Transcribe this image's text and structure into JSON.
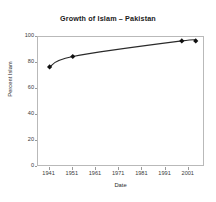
{
  "chart_data": {
    "type": "line",
    "title": "Growth of Islam – Pakistan",
    "xlabel": "Date",
    "ylabel": "Percent Islam",
    "xlim": [
      1936,
      2008
    ],
    "ylim": [
      0,
      100
    ],
    "xticks": [
      1941,
      1951,
      1961,
      1971,
      1981,
      1991,
      2001
    ],
    "xtick_labels": [
      "1941",
      "1951",
      "1961",
      "1971",
      "1981",
      "1991",
      "2001"
    ],
    "yticks": [
      0,
      20,
      40,
      60,
      80,
      100
    ],
    "ytick_labels": [
      "0",
      "20",
      "40",
      "60",
      "80",
      "100"
    ],
    "grid": false,
    "legend": "none",
    "series": [
      {
        "name": "Percent Islam",
        "marker": "diamond",
        "marker_color": "#111111",
        "line_color": "#2a2a2a",
        "x": [
          1941,
          1951,
          1998,
          2004
        ],
        "values": [
          77,
          85,
          97,
          97
        ],
        "points": [
          {
            "x": 1941,
            "y": 77
          },
          {
            "x": 1951,
            "y": 85
          },
          {
            "x": 1998,
            "y": 97
          },
          {
            "x": 2004,
            "y": 97
          }
        ]
      }
    ],
    "colors": {
      "line": "#2a2a2a",
      "marker": "#111111",
      "axis": "#b9b9b9",
      "text": "#2b2b2b",
      "background": "#ffffff"
    }
  }
}
